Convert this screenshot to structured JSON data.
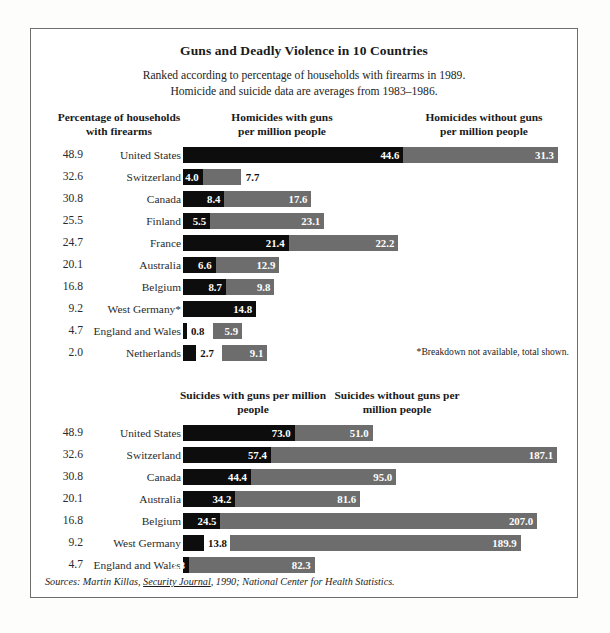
{
  "title": "Guns and Deadly Violence in 10 Countries",
  "subtitle_line1": "Ranked according to percentage of households with firearms in 1989.",
  "subtitle_line2": "Homicide and suicide data are averages from 1983–1986.",
  "headers": {
    "pct_l1": "Percentage of households",
    "pct_l2": "with firearms",
    "homicide_with_l1": "Homicides with guns",
    "homicide_with_l2": "per million people",
    "homicide_without_l1": "Homicides without guns",
    "homicide_without_l2": "per million people",
    "suicide_with_l1": "Suicides with guns",
    "suicide_with_l2": "per million people",
    "suicide_without_l1": "Suicides without guns",
    "suicide_without_l2": "per million people"
  },
  "footnote": "*Breakdown not available, total shown.",
  "sources_prefix": "Sources: Martin Killas, ",
  "sources_italic_title": "Security Journal",
  "sources_suffix": ", 1990; National Center for Health Statistics.",
  "colors": {
    "with_guns": "#0d0d0d",
    "without_guns": "#6d6d6d",
    "frame": "#6e6e6e",
    "page_bg": "#fdfdfc"
  },
  "chart_data": [
    {
      "type": "bar",
      "orientation": "horizontal",
      "stacked": true,
      "title": "Homicides per million people",
      "xlabel": "Homicides per million people",
      "ylabel": "Country",
      "grid": false,
      "legend": [
        "Homicides with guns per million people",
        "Homicides without guns per million people"
      ],
      "px_per_unit": 4.94,
      "categories": [
        "United States",
        "Switzerland",
        "Canada",
        "Finland",
        "France",
        "Australia",
        "Belgium",
        "West Germany*",
        "England and Wales",
        "Netherlands"
      ],
      "household_firearm_pct": [
        48.9,
        32.6,
        30.8,
        25.5,
        24.7,
        20.1,
        16.8,
        9.2,
        4.7,
        2.0
      ],
      "series": [
        {
          "name": "Homicides with guns per million people",
          "color": "#0d0d0d",
          "values": [
            44.6,
            4.0,
            8.4,
            5.5,
            21.4,
            6.6,
            8.7,
            14.8,
            0.8,
            2.7
          ]
        },
        {
          "name": "Homicides without guns per million people",
          "color": "#6d6d6d",
          "values": [
            31.3,
            7.7,
            17.6,
            23.1,
            22.2,
            12.9,
            9.8,
            null,
            5.9,
            9.1
          ]
        }
      ],
      "rows": [
        {
          "pct": "48.9",
          "country": "United States",
          "with": {
            "label": "44.6",
            "value": 44.6,
            "inside": true
          },
          "without": {
            "label": "31.3",
            "value": 31.3,
            "inside": true
          }
        },
        {
          "pct": "32.6",
          "country": "Switzerland",
          "with": {
            "label": "4.0",
            "value": 4.0,
            "inside": true
          },
          "without": {
            "label": "7.7",
            "value": 7.7,
            "inside": false
          }
        },
        {
          "pct": "30.8",
          "country": "Canada",
          "with": {
            "label": "8.4",
            "value": 8.4,
            "inside": true
          },
          "without": {
            "label": "17.6",
            "value": 17.6,
            "inside": true
          }
        },
        {
          "pct": "25.5",
          "country": "Finland",
          "with": {
            "label": "5.5",
            "value": 5.5,
            "inside": true
          },
          "without": {
            "label": "23.1",
            "value": 23.1,
            "inside": true
          }
        },
        {
          "pct": "24.7",
          "country": "France",
          "with": {
            "label": "21.4",
            "value": 21.4,
            "inside": true
          },
          "without": {
            "label": "22.2",
            "value": 22.2,
            "inside": true
          }
        },
        {
          "pct": "20.1",
          "country": "Australia",
          "with": {
            "label": "6.6",
            "value": 6.6,
            "inside": true
          },
          "without": {
            "label": "12.9",
            "value": 12.9,
            "inside": true
          }
        },
        {
          "pct": "16.8",
          "country": "Belgium",
          "with": {
            "label": "8.7",
            "value": 8.7,
            "inside": true
          },
          "without": {
            "label": "9.8",
            "value": 9.8,
            "inside": true
          }
        },
        {
          "pct": "9.2",
          "country": "West Germany*",
          "with": {
            "label": "14.8",
            "value": 14.8,
            "inside": true
          },
          "without": null
        },
        {
          "pct": "4.7",
          "country": "England and Wales",
          "with": {
            "label": "0.8",
            "value": 0.8,
            "inside": false
          },
          "without": {
            "label": "5.9",
            "value": 5.9,
            "inside": true
          }
        },
        {
          "pct": "2.0",
          "country": "Netherlands",
          "with": {
            "label": "2.7",
            "value": 2.7,
            "inside": false
          },
          "without": {
            "label": "9.1",
            "value": 9.1,
            "inside": true
          }
        }
      ]
    },
    {
      "type": "bar",
      "orientation": "horizontal",
      "stacked": true,
      "title": "Suicides per million people",
      "xlabel": "Suicides per million people",
      "ylabel": "Country",
      "grid": false,
      "legend": [
        "Suicides with guns per million people",
        "Suicides without guns per million people"
      ],
      "px_per_unit": 1.53,
      "categories": [
        "United States",
        "Switzerland",
        "Canada",
        "Australia",
        "Belgium",
        "West Germany",
        "England and Wales"
      ],
      "household_firearm_pct": [
        48.9,
        32.6,
        30.8,
        20.1,
        16.8,
        9.2,
        4.7
      ],
      "series": [
        {
          "name": "Suicides with guns per million people",
          "color": "#0d0d0d",
          "values": [
            73.0,
            57.4,
            44.4,
            34.2,
            24.5,
            13.8,
            3.8
          ]
        },
        {
          "name": "Suicides without guns per million people",
          "color": "#6d6d6d",
          "values": [
            51.0,
            187.1,
            95.0,
            81.6,
            207.0,
            189.9,
            82.3
          ]
        }
      ],
      "rows": [
        {
          "pct": "48.9",
          "country": "United States",
          "with": {
            "label": "73.0",
            "value": 73.0,
            "inside": true
          },
          "without": {
            "label": "51.0",
            "value": 51.0,
            "inside": true
          }
        },
        {
          "pct": "32.6",
          "country": "Switzerland",
          "with": {
            "label": "57.4",
            "value": 57.4,
            "inside": true
          },
          "without": {
            "label": "187.1",
            "value": 187.1,
            "inside": true
          }
        },
        {
          "pct": "30.8",
          "country": "Canada",
          "with": {
            "label": "44.4",
            "value": 44.4,
            "inside": true
          },
          "without": {
            "label": "95.0",
            "value": 95.0,
            "inside": true
          }
        },
        {
          "pct": "20.1",
          "country": "Australia",
          "with": {
            "label": "34.2",
            "value": 34.2,
            "inside": true
          },
          "without": {
            "label": "81.6",
            "value": 81.6,
            "inside": true
          }
        },
        {
          "pct": "16.8",
          "country": "Belgium",
          "with": {
            "label": "24.5",
            "value": 24.5,
            "inside": true
          },
          "without": {
            "label": "207.0",
            "value": 207.0,
            "inside": true
          }
        },
        {
          "pct": "9.2",
          "country": "West Germany",
          "with": {
            "label": "13.8",
            "value": 13.8,
            "inside": false
          },
          "without": {
            "label": "189.9",
            "value": 189.9,
            "inside": true
          }
        },
        {
          "pct": "4.7",
          "country": "England and Wales",
          "with": {
            "label": "3.8",
            "value": 3.8,
            "inside": true
          },
          "without": {
            "label": "82.3",
            "value": 82.3,
            "inside": true
          }
        }
      ]
    }
  ]
}
